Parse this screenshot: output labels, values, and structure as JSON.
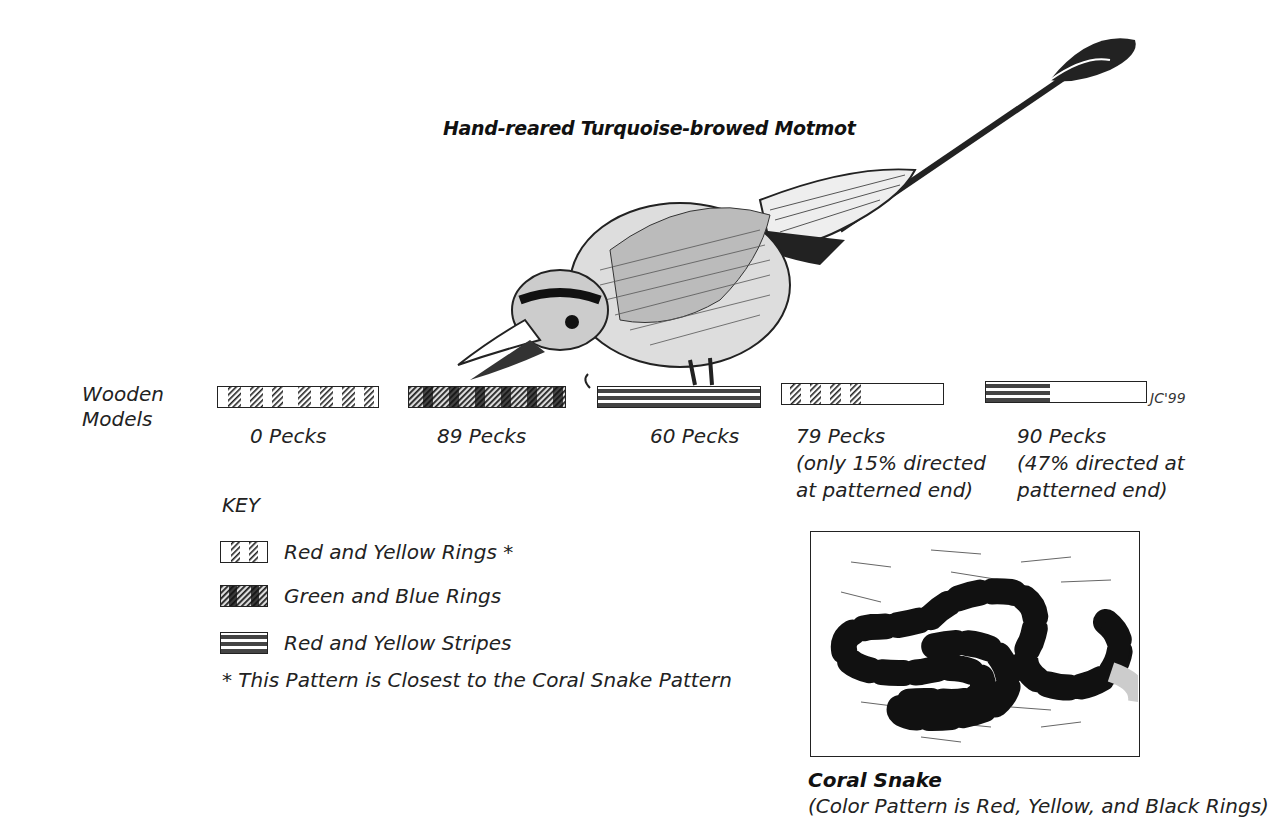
{
  "title": "Hand-reared Turquoise-browed Motmot",
  "models_label_line1": "Wooden",
  "models_label_line2": "Models",
  "models": [
    {
      "pattern": "red-yellow-rings",
      "pecks_label": "0 Pecks",
      "note_line1": "",
      "note_line2": ""
    },
    {
      "pattern": "green-blue-rings",
      "pecks_label": "89 Pecks",
      "note_line1": "",
      "note_line2": ""
    },
    {
      "pattern": "red-yellow-stripes",
      "pecks_label": "60 Pecks",
      "note_line1": "",
      "note_line2": ""
    },
    {
      "pattern": "red-yellow-rings-half",
      "pecks_label": "79 Pecks",
      "note_line1": "(only 15% directed",
      "note_line2": "at patterned end)"
    },
    {
      "pattern": "red-yellow-stripes-half",
      "pecks_label": "90 Pecks",
      "note_line1": "(47% directed at",
      "note_line2": "patterned end)"
    }
  ],
  "signature": "JC'99",
  "key": {
    "title": "KEY",
    "items": [
      {
        "pattern": "red-yellow-rings",
        "label": "Red and Yellow Rings *"
      },
      {
        "pattern": "green-blue-rings",
        "label": "Green and Blue Rings"
      },
      {
        "pattern": "red-yellow-stripes",
        "label": "Red and Yellow Stripes"
      }
    ],
    "footnote": "* This Pattern is Closest to the Coral Snake Pattern"
  },
  "snake": {
    "title": "Coral Snake",
    "caption": "(Color Pattern is Red, Yellow, and Black Rings)"
  },
  "colors": {
    "ink": "#1a1a1a",
    "paper": "#ffffff"
  }
}
